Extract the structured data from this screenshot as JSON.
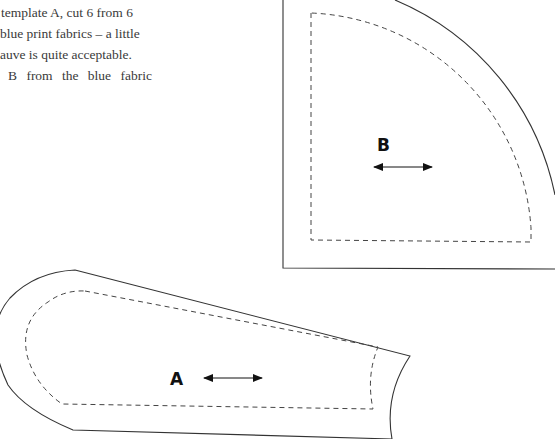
{
  "instructions": {
    "lines": [
      "template A, cut 6 from 6",
      "blue print fabrics – a little",
      "auve is quite acceptable.",
      "B from the blue fabric"
    ]
  },
  "pieces": {
    "A": {
      "label": "A",
      "grainline": "horizontal double arrow"
    },
    "B": {
      "label": "B",
      "grainline": "horizontal double arrow"
    }
  },
  "colors": {
    "cut_line": "#333333",
    "seam_line": "#444444",
    "text": "#3a3a3a"
  }
}
